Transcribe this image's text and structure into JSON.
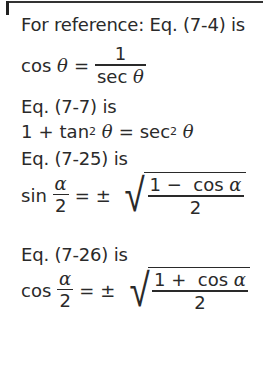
{
  "intro": "For reference: Eq. (7-4) is",
  "eq_7_4": {
    "lhs_func": "cos",
    "lhs_var": "θ",
    "equals": "=",
    "numerator": "1",
    "denominator_func": "sec",
    "denominator_var": "θ"
  },
  "label_7_7": "Eq. (7-7) is",
  "eq_7_7": {
    "one": "1",
    "plus": "+",
    "tan": "tan",
    "exp1": "2",
    "var1": "θ",
    "equals": "=",
    "sec": "sec",
    "exp2": "2",
    "var2": "θ"
  },
  "label_7_25": "Eq. (7-25) is",
  "eq_7_25": {
    "func": "sin",
    "frac_num": "α",
    "frac_den": "2",
    "equals": "=",
    "pm": "±",
    "radical": "√",
    "rad_num_one": "1",
    "rad_num_op": "−",
    "rad_num_func": "cos",
    "rad_num_var": "α",
    "rad_den": "2"
  },
  "label_7_26": "Eq. (7-26) is",
  "eq_7_26": {
    "func": "cos",
    "frac_num": "α",
    "frac_den": "2",
    "equals": "=",
    "pm": "±",
    "radical": "√",
    "rad_num_one": "1",
    "rad_num_op": "+",
    "rad_num_func": "cos",
    "rad_num_var": "α",
    "rad_den": "2"
  }
}
